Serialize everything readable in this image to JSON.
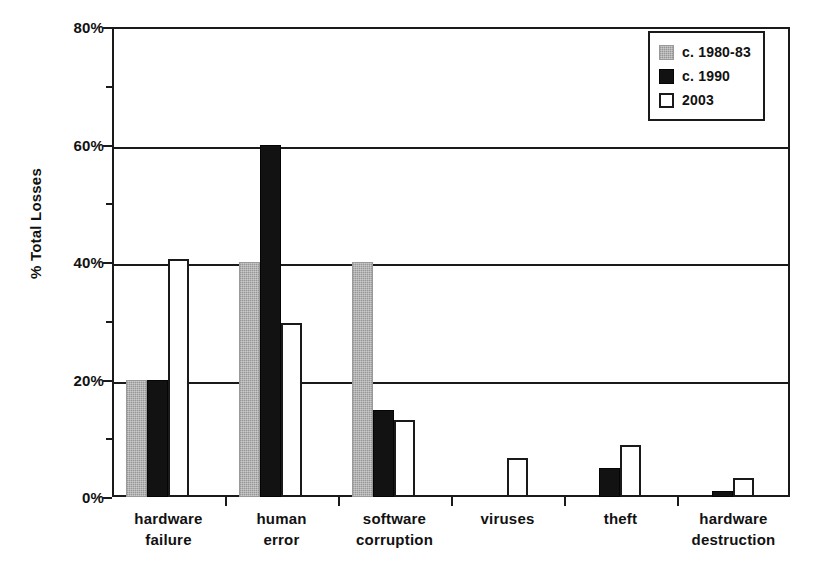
{
  "chart_data": {
    "type": "bar",
    "title": "",
    "xlabel": "",
    "ylabel": "% Total Losses",
    "ylim": [
      0,
      80
    ],
    "y_ticks": [
      "0%",
      "20%",
      "40%",
      "60%",
      "80%"
    ],
    "y_tick_values": [
      0,
      20,
      40,
      60,
      80
    ],
    "y_minor_tick_values": [
      10,
      30,
      50,
      70
    ],
    "grid": true,
    "grid_axis": "y",
    "legend_position": "top-right",
    "categories": [
      "hardware failure",
      "human error",
      "software corruption",
      "viruses",
      "theft",
      "hardware destruction"
    ],
    "category_lines": [
      [
        "hardware",
        "failure"
      ],
      [
        "human",
        "error"
      ],
      [
        "software",
        "corruption"
      ],
      [
        "viruses",
        ""
      ],
      [
        "theft",
        ""
      ],
      [
        "hardware",
        "destruction"
      ]
    ],
    "series": [
      {
        "name": "c. 1980-83",
        "color": "#a8a8a8",
        "values": [
          20,
          40,
          40,
          0,
          0,
          0
        ]
      },
      {
        "name": "c. 1990",
        "color": "#121212",
        "values": [
          20,
          60,
          14.8,
          0,
          5,
          1
        ]
      },
      {
        "name": "2003",
        "color": "#ffffff",
        "values": [
          40.5,
          29.6,
          13.1,
          6.6,
          8.8,
          3.2
        ]
      }
    ]
  },
  "legend": {
    "items": [
      {
        "label": "c. 1980-83"
      },
      {
        "label": "c. 1990"
      },
      {
        "label": "2003"
      }
    ]
  },
  "axes": {
    "y_title": "% Total Losses"
  },
  "colors": {
    "axis": "#1a1a1a",
    "series_1980": "#a8a8a8",
    "series_1990": "#121212",
    "series_2003": "#ffffff",
    "background": "#ffffff"
  }
}
